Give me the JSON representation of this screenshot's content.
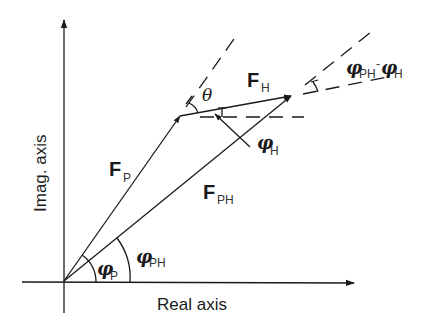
{
  "diagram": {
    "type": "phasor-vector-diagram",
    "axes": {
      "x_label": "Real axis",
      "y_label": "Imag. axis"
    },
    "vectors": [
      {
        "id": "FP",
        "symbol": "F",
        "subscript": "P"
      },
      {
        "id": "FH",
        "symbol": "F",
        "subscript": "H"
      },
      {
        "id": "FPH",
        "symbol": "F",
        "subscript": "PH"
      }
    ],
    "angles": [
      {
        "id": "phi_P",
        "symbol": "φ",
        "subscript": "P"
      },
      {
        "id": "phi_PH",
        "symbol": "φ",
        "subscript": "PH"
      },
      {
        "id": "phi_H",
        "symbol": "φ",
        "subscript": "H"
      },
      {
        "id": "theta",
        "symbol": "θ",
        "subscript": ""
      },
      {
        "id": "phi_PH_minus_phi_H",
        "symbol": "φ",
        "subscript": "PH",
        "minus": "-",
        "symbol2": "φ",
        "subscript2": "H"
      }
    ]
  }
}
